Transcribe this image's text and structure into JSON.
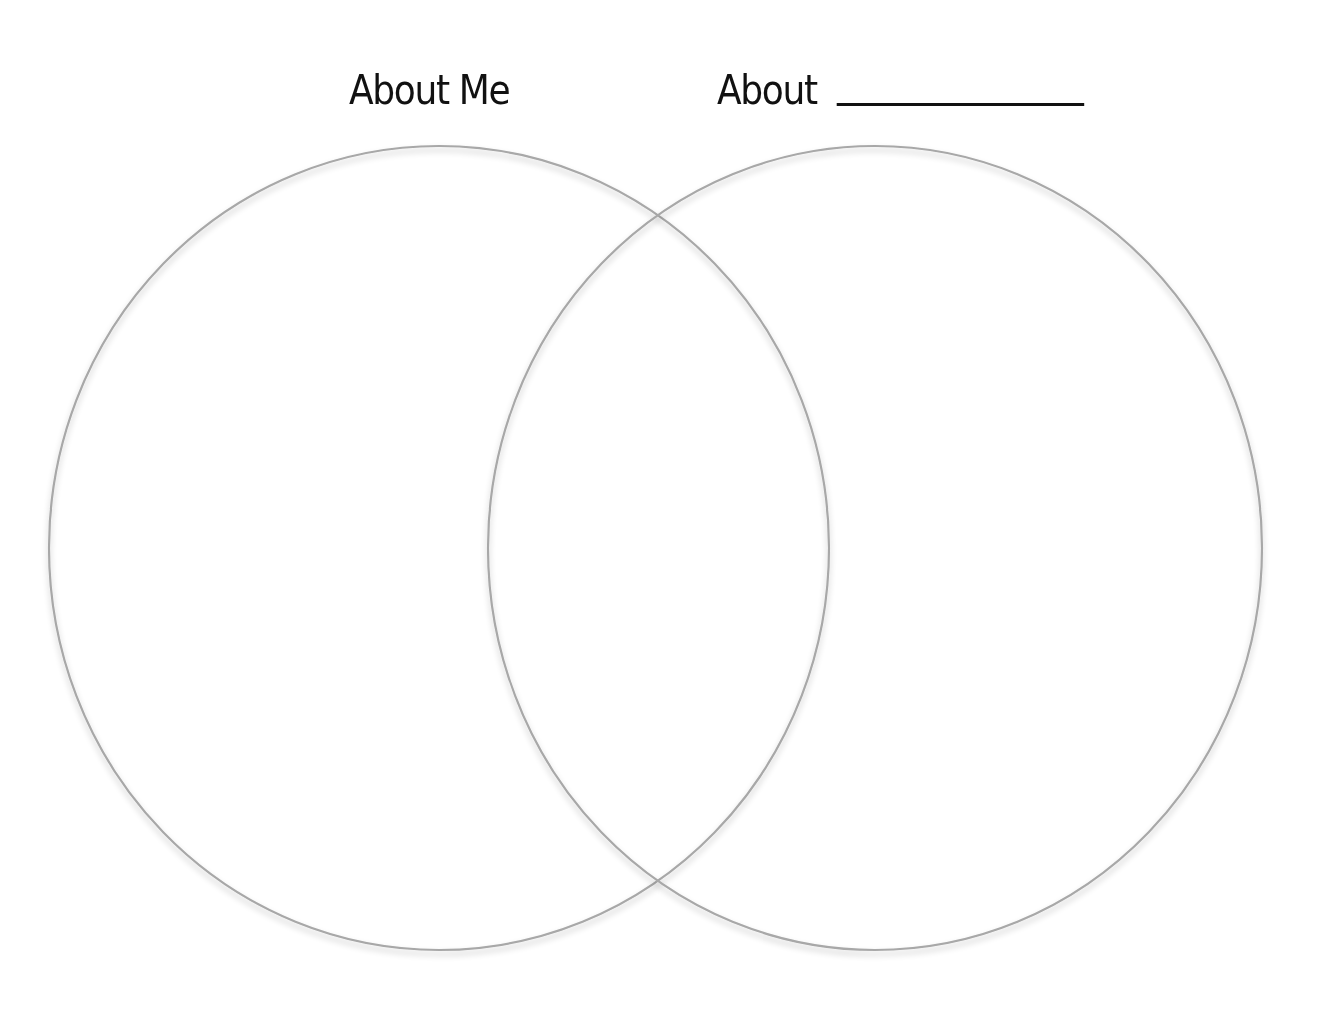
{
  "diagram": {
    "type": "venn",
    "titles": {
      "left": "About Me",
      "right": "About",
      "right_blank": "___________"
    },
    "circles": [
      {
        "name": "about-me",
        "cx": 439,
        "cy": 548,
        "rx": 390,
        "ry": 402
      },
      {
        "name": "about-other",
        "cx": 875,
        "cy": 548,
        "rx": 387,
        "ry": 402
      }
    ],
    "stroke_color": "#a8a8a8",
    "shadow_color": "#c8c8c8",
    "background": "#ffffff"
  }
}
